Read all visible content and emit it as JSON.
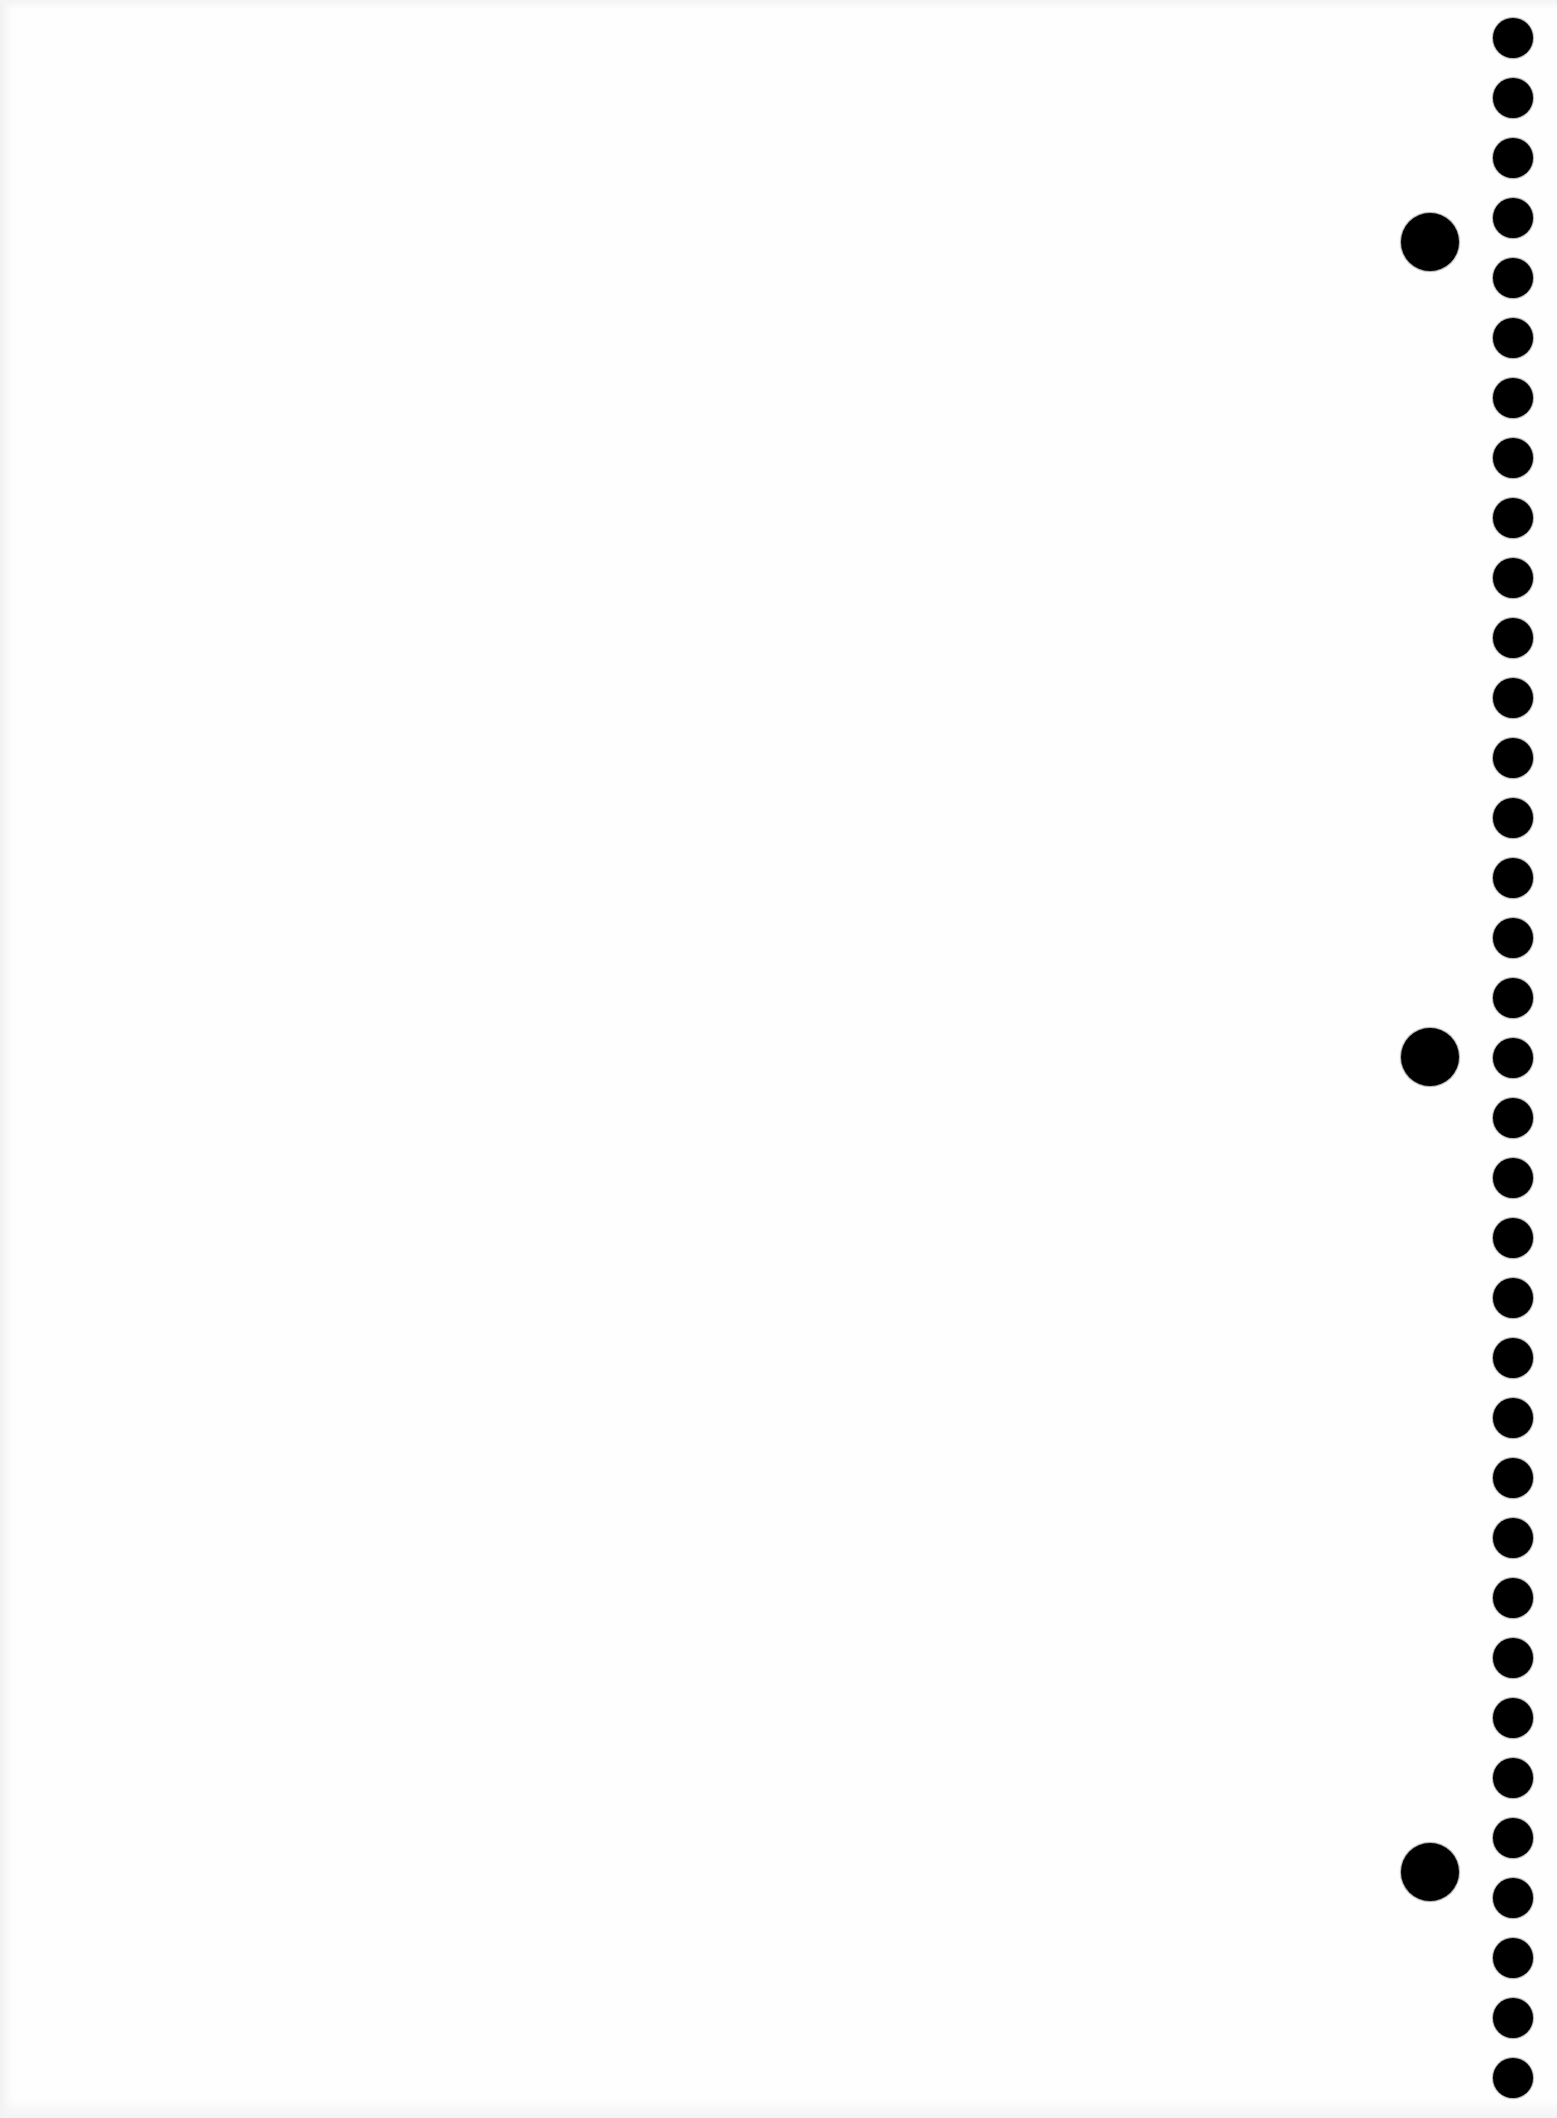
{
  "document": {
    "type": "blank-notebook-page",
    "background_color": "#fefefe",
    "text_content": ""
  },
  "binding_holes": {
    "small": {
      "count": 35,
      "center_x": 1513,
      "first_center_y": 38,
      "spacing": 60,
      "diameter": 40,
      "color": "#000000"
    },
    "large": {
      "center_x": 1430,
      "diameter": 58,
      "centers_y": [
        242,
        1057,
        1872
      ],
      "color": "#000000"
    }
  }
}
